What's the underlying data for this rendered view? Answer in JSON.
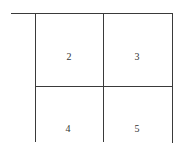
{
  "diagram": {
    "type": "grid",
    "rows": 2,
    "cols": 2,
    "cells": [
      {
        "label": "2",
        "row": 0,
        "col": 0
      },
      {
        "label": "3",
        "row": 0,
        "col": 1
      },
      {
        "label": "4",
        "row": 1,
        "col": 0
      },
      {
        "label": "5",
        "row": 1,
        "col": 1
      }
    ],
    "line_color": "#3a3a3a"
  }
}
